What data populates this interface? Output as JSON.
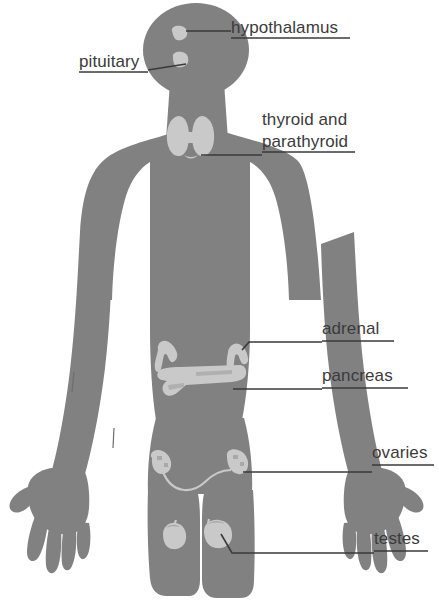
{
  "figure": {
    "type": "anatomical-diagram",
    "background_color": "#ffffff",
    "body_color": "#818181",
    "gland_color": "#c9c9c9",
    "label_color": "#3b3b3b",
    "leader_color": "#3a3a3a"
  },
  "labels": [
    {
      "id": "hypothalamus",
      "text": "hypothalamus",
      "text_x": 231,
      "text_y": 33,
      "underline": {
        "x1": 231,
        "y1": 38,
        "x2": 350,
        "y2": 38
      },
      "leader": "M 186,31 L 231,31",
      "side": "right"
    },
    {
      "id": "pituitary",
      "text": "pituitary",
      "text_x": 79,
      "text_y": 67,
      "underline": {
        "x1": 79,
        "y1": 72,
        "x2": 148,
        "y2": 72
      },
      "leader": "M 148,70 L 186,64",
      "side": "left"
    },
    {
      "id": "thyroid-and-parathyroid",
      "text_line1": "thyroid and",
      "text_line2": "parathyroid",
      "text_x": 262,
      "text_y": 125,
      "text_y2": 147,
      "underline": {
        "x1": 262,
        "y1": 152,
        "x2": 355,
        "y2": 152
      },
      "leader": "M 201,155 L 262,155",
      "side": "right"
    },
    {
      "id": "adrenal",
      "text": "adrenal",
      "text_x": 322,
      "text_y": 334,
      "underline": {
        "x1": 322,
        "y1": 341,
        "x2": 394,
        "y2": 341
      },
      "leader": "M 242,350 L 249,342 L 322,342",
      "side": "right"
    },
    {
      "id": "pancreas",
      "text": "pancreas",
      "text_x": 322,
      "text_y": 381,
      "underline": {
        "x1": 322,
        "y1": 388,
        "x2": 408,
        "y2": 388
      },
      "leader": "M 233,389 L 322,389",
      "side": "right"
    },
    {
      "id": "ovaries",
      "text": "ovaries",
      "text_x": 372,
      "text_y": 458,
      "underline": {
        "x1": 372,
        "y1": 465,
        "x2": 434,
        "y2": 465
      },
      "leader": "M 243,472 L 372,472",
      "side": "right"
    },
    {
      "id": "testes",
      "text": "testes",
      "text_x": 374,
      "text_y": 544,
      "underline": {
        "x1": 374,
        "y1": 551,
        "x2": 428,
        "y2": 551
      },
      "leader": "M 221,534 L 232,553 L 374,553",
      "side": "right"
    }
  ],
  "glands": [
    {
      "id": "hypothalamus-gland",
      "name": "hypothalamus"
    },
    {
      "id": "pituitary-gland",
      "name": "pituitary"
    },
    {
      "id": "thyroid-gland",
      "name": "thyroid and parathyroid"
    },
    {
      "id": "adrenal-gland-left",
      "name": "adrenal left"
    },
    {
      "id": "adrenal-gland-right",
      "name": "adrenal right"
    },
    {
      "id": "pancreas-gland",
      "name": "pancreas"
    },
    {
      "id": "ovary-left",
      "name": "ovary left"
    },
    {
      "id": "ovary-right",
      "name": "ovary right"
    },
    {
      "id": "testis-left",
      "name": "testis left"
    },
    {
      "id": "testis-right",
      "name": "testis right"
    }
  ]
}
